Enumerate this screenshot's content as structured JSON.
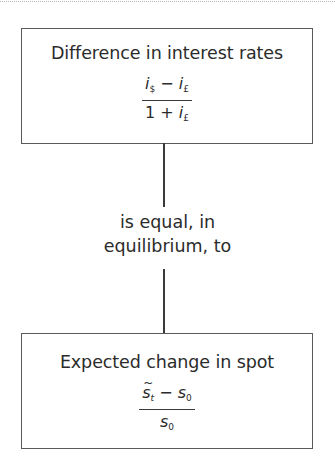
{
  "diagram": {
    "top_box": {
      "title": "Difference in interest rates",
      "formula": {
        "numerator": {
          "term1_var": "i",
          "term1_sub": "$",
          "operator": "−",
          "term2_var": "i",
          "term2_sub": "£"
        },
        "denominator": {
          "constant": "1",
          "operator": "+",
          "term_var": "i",
          "term_sub": "£"
        }
      }
    },
    "connector_label": {
      "line1": "is equal, in",
      "line2": "equilibrium, to"
    },
    "bottom_box": {
      "title": "Expected change in spot",
      "formula": {
        "numerator": {
          "term1_var": "s",
          "term1_sub": "t",
          "operator": "−",
          "term2_var": "s",
          "term2_sub": "0"
        },
        "denominator": {
          "term_var": "s",
          "term_sub": "0"
        }
      }
    }
  },
  "colors": {
    "border": "#5a5a5a",
    "connector": "#3a3a3a",
    "text": "#2b2b2b",
    "background": "#ffffff"
  }
}
